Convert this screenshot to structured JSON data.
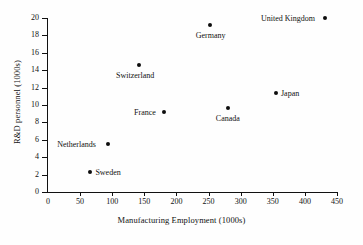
{
  "chart_data": {
    "type": "scatter",
    "title": "",
    "xlabel": "Manufacturing Employment (1000s)",
    "ylabel": "R&D personnel (1000s)",
    "xlim": [
      0,
      450
    ],
    "ylim": [
      0,
      20
    ],
    "grid": false,
    "legend": "none",
    "xticks": [
      0,
      50,
      100,
      150,
      200,
      250,
      300,
      350,
      400,
      450
    ],
    "xtick_labels": [
      "0",
      "50",
      "100",
      "150",
      "200",
      "250",
      "300",
      "350",
      "400",
      "450"
    ],
    "yticks": [
      0,
      2,
      4,
      6,
      8,
      10,
      12,
      14,
      16,
      18,
      20
    ],
    "ytick_labels": [
      "0",
      "2",
      "4",
      "6",
      "8",
      "10",
      "12",
      "14",
      "16",
      "18",
      "20"
    ],
    "marker_color": "#0d0d0d",
    "points": [
      {
        "label": "Sweden",
        "x": 66,
        "y": 2.3,
        "label_pos": "right"
      },
      {
        "label": "Netherlands",
        "x": 94,
        "y": 5.5,
        "label_pos": "left"
      },
      {
        "label": "France",
        "x": 181,
        "y": 9.2,
        "label_pos": "left"
      },
      {
        "label": "Switzerland",
        "x": 142,
        "y": 14.6,
        "label_pos": "below"
      },
      {
        "label": "Canada",
        "x": 281,
        "y": 9.7,
        "label_pos": "below"
      },
      {
        "label": "Japan",
        "x": 355,
        "y": 11.4,
        "label_pos": "right"
      },
      {
        "label": "Germany",
        "x": 253,
        "y": 19.2,
        "label_pos": "below"
      },
      {
        "label": "United Kingdom",
        "x": 431,
        "y": 20.0,
        "label_pos": "left"
      }
    ]
  }
}
